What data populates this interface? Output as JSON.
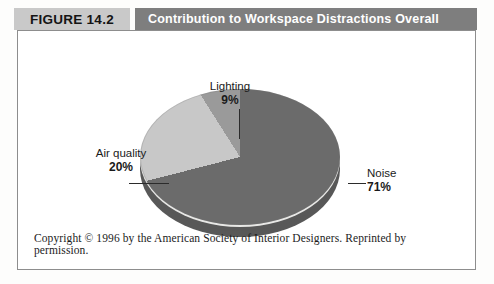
{
  "figure": {
    "tag": "FIGURE 14.2",
    "title": "Contribution to Workspace Distractions Overall",
    "footer": "Copyright © 1996 by the American Society of Interior Designers. Reprinted by permission."
  },
  "colors": {
    "tag_background": "#c9c9c9",
    "title_background": "#7e7e7e",
    "title_text": "#ffffff",
    "frame_border": "#8d8d8d",
    "slice_noise": "#6b6b6b",
    "slice_air_quality": "#c8c8c8",
    "slice_lighting": "#9a9a9a",
    "pie_depth": "#585858",
    "page_background": "#ffffff"
  },
  "chart_data": {
    "type": "pie",
    "title": "Contribution to Workspace Distractions Overall",
    "categories": [
      "Noise",
      "Air quality",
      "Lighting"
    ],
    "values": [
      71,
      20,
      9
    ],
    "unit": "%",
    "labels": [
      {
        "name": "Noise",
        "value": "71%",
        "color": "#6b6b6b"
      },
      {
        "name": "Air quality",
        "value": "20%",
        "color": "#c8c8c8"
      },
      {
        "name": "Lighting",
        "value": "9%",
        "color": "#9a9a9a"
      }
    ],
    "legend": "none",
    "data_labels": true,
    "three_d": true,
    "xlabel": "",
    "ylabel": ""
  }
}
